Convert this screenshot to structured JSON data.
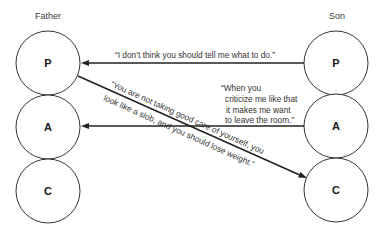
{
  "people": {
    "left": {
      "label": "Father",
      "states": [
        {
          "id": "P",
          "label": "P"
        },
        {
          "id": "A",
          "label": "A"
        },
        {
          "id": "C",
          "label": "C"
        }
      ]
    },
    "right": {
      "label": "Son",
      "states": [
        {
          "id": "P",
          "label": "P"
        },
        {
          "id": "A",
          "label": "A"
        },
        {
          "id": "C",
          "label": "C"
        }
      ]
    }
  },
  "transactions": [
    {
      "from": "Son.P",
      "to": "Father.P",
      "lines": [
        "“I don’t think you should tell me what to do.”"
      ]
    },
    {
      "from": "Father.P",
      "to": "Son.C",
      "lines": [
        "“You are not taking good care of yourself, you",
        "look like a slob, and you should lose weight.”"
      ]
    },
    {
      "from": "Son.A",
      "to": "Father.A",
      "lines": [
        "“When you",
        "criticize me like that",
        "it makes me want",
        "to leave the room.”"
      ]
    }
  ],
  "colors": {
    "stroke": "#222222",
    "text": "#333333",
    "background": "#ffffff"
  }
}
